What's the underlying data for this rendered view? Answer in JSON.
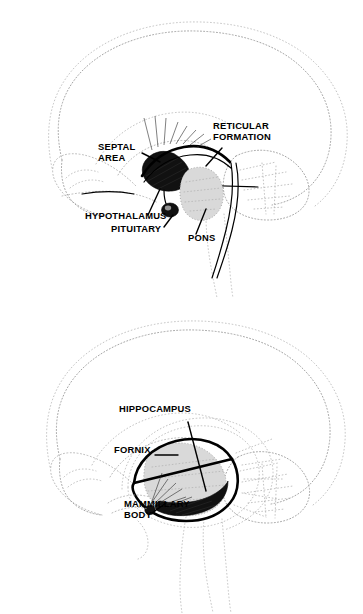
{
  "document": {
    "title": "Brain Limbic System — Lateral Views",
    "background_color": "#ffffff",
    "ink_color": "#000000",
    "outline_color": "#9a9a9a"
  },
  "panels": [
    {
      "id": "upper-brain",
      "name": "Midbrain and brainstem structures",
      "labels": [
        {
          "id": "septal-area",
          "lines": [
            "SEPTAL",
            "AREA"
          ],
          "x": 98,
          "y": 150
        },
        {
          "id": "reticular-formation",
          "lines": [
            "RETICULAR",
            "FORMATION"
          ],
          "x": 213,
          "y": 129
        },
        {
          "id": "hypothalamus",
          "lines": [
            "HYPOTHALAMUS"
          ],
          "x": 85,
          "y": 219
        },
        {
          "id": "pituitary",
          "lines": [
            "PITUITARY"
          ],
          "x": 111,
          "y": 232
        },
        {
          "id": "pons",
          "lines": [
            "PONS"
          ],
          "x": 188,
          "y": 241
        }
      ],
      "structures": [
        "septal area",
        "reticular formation",
        "hypothalamus",
        "pituitary",
        "pons",
        "cerebellum",
        "brainstem"
      ]
    },
    {
      "id": "lower-brain",
      "name": "Hippocampus and fornix structures",
      "labels": [
        {
          "id": "hippocampus",
          "lines": [
            "HIPPOCAMPUS"
          ],
          "x": 119,
          "y": 412
        },
        {
          "id": "fornix",
          "lines": [
            "FORNIX"
          ],
          "x": 114,
          "y": 453
        },
        {
          "id": "mammillary-body",
          "lines": [
            "MAMMILLARY",
            "BODY"
          ],
          "x": 124,
          "y": 507
        }
      ],
      "structures": [
        "hippocampus",
        "fornix",
        "mammillary body",
        "cerebellum",
        "brainstem"
      ]
    }
  ]
}
